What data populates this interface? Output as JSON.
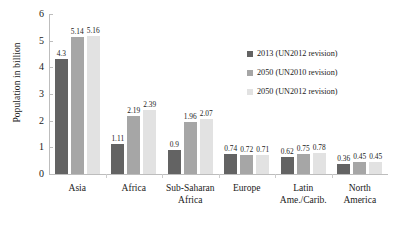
{
  "chart_data": {
    "type": "bar",
    "title": "",
    "xlabel": "",
    "ylabel": "Population in billion",
    "ylim": [
      0,
      6
    ],
    "ytick_labels": [
      "0",
      "1",
      "2",
      "3",
      "4",
      "5",
      "6"
    ],
    "ytick_values": [
      0,
      1,
      2,
      3,
      4,
      5,
      6
    ],
    "grid": false,
    "legend_position": "inside-upper-right",
    "categories": [
      "Asia",
      "Africa",
      "Sub-Saharan\nAfrica",
      "Europe",
      "Latin\nAme./Carib.",
      "North\nAmerica"
    ],
    "series": [
      {
        "name": "2013 (UN2012 revision)",
        "color": "#636363",
        "values": [
          4.3,
          1.11,
          0.9,
          0.74,
          0.62,
          0.36
        ],
        "labels": [
          "4.3",
          "1.11",
          "0.9",
          "0.74",
          "0.62",
          "0.36"
        ]
      },
      {
        "name": "2050 (UN2010 revision)",
        "color": "#a6a6a6",
        "values": [
          5.14,
          2.19,
          1.96,
          0.72,
          0.75,
          0.45
        ],
        "labels": [
          "5.14",
          "2.19",
          "1.96",
          "0.72",
          "0.75",
          "0.45"
        ]
      },
      {
        "name": "2050 (UN2012 revision)",
        "color": "#e2e2e2",
        "values": [
          5.16,
          2.39,
          2.07,
          0.71,
          0.78,
          0.45
        ],
        "labels": [
          "5.16",
          "2.39",
          "2.07",
          "0.71",
          "0.78",
          "0.45"
        ]
      }
    ]
  },
  "legend": {
    "items": [
      {
        "label": "2013 (UN2012 revision)",
        "color": "#636363"
      },
      {
        "label": "2050 (UN2010 revision)",
        "color": "#a6a6a6"
      },
      {
        "label": "2050 (UN2012 revision)",
        "color": "#e2e2e2"
      }
    ]
  }
}
